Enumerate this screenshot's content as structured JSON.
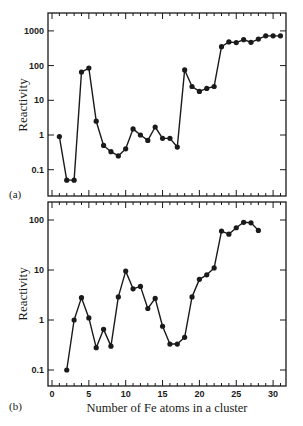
{
  "figure": {
    "xlabel": "Number of Fe atoms in a cluster",
    "panels": [
      {
        "label": "(a)",
        "ylabel": "Reactivity",
        "y_ticks": [
          {
            "value": 1000,
            "label": "1000"
          },
          {
            "value": 100,
            "label": "100"
          },
          {
            "value": 10,
            "label": "10"
          },
          {
            "value": 1,
            "label": "1"
          },
          {
            "value": 0.1,
            "label": "0.1"
          }
        ]
      },
      {
        "label": "(b)",
        "ylabel": "Reactivity",
        "y_ticks": [
          {
            "value": 100,
            "label": "100"
          },
          {
            "value": 10,
            "label": "10"
          },
          {
            "value": 1,
            "label": "1"
          },
          {
            "value": 0.1,
            "label": "0.1"
          }
        ],
        "x_ticks": [
          {
            "value": 0,
            "label": "0"
          },
          {
            "value": 5,
            "label": "5"
          },
          {
            "value": 10,
            "label": "10"
          },
          {
            "value": 15,
            "label": "15"
          },
          {
            "value": 20,
            "label": "20"
          },
          {
            "value": 25,
            "label": "25"
          },
          {
            "value": 30,
            "label": "30"
          }
        ]
      }
    ]
  },
  "chart_data": [
    {
      "type": "line",
      "title": "(a)",
      "xlabel": "Number of Fe atoms in a cluster",
      "ylabel": "Reactivity",
      "yscale": "log",
      "xlim": [
        0,
        31.5
      ],
      "ylim": [
        0.02,
        3000
      ],
      "grid": false,
      "x": [
        1,
        2,
        3,
        4,
        5,
        6,
        7,
        8,
        9,
        10,
        11,
        12,
        13,
        14,
        15,
        16,
        17,
        18,
        19,
        20,
        21,
        22,
        23,
        24,
        25,
        26,
        27,
        28,
        29,
        30,
        31
      ],
      "values": [
        0.9,
        0.05,
        0.05,
        65,
        85,
        2.5,
        0.5,
        0.33,
        0.25,
        0.4,
        1.5,
        1.0,
        0.7,
        1.7,
        0.8,
        0.8,
        0.45,
        75,
        25,
        18,
        22,
        25,
        350,
        480,
        460,
        560,
        470,
        580,
        720,
        720,
        720
      ]
    },
    {
      "type": "line",
      "title": "(b)",
      "xlabel": "Number of Fe atoms in a cluster",
      "ylabel": "Reactivity",
      "yscale": "log",
      "xlim": [
        0,
        31.5
      ],
      "ylim": [
        0.05,
        200
      ],
      "grid": false,
      "x": [
        2,
        3,
        4,
        5,
        6,
        7,
        8,
        9,
        10,
        11,
        12,
        13,
        14,
        15,
        16,
        17,
        18,
        19,
        20,
        21,
        22,
        23,
        24,
        25,
        26,
        27,
        28
      ],
      "values": [
        0.1,
        1.0,
        2.8,
        1.1,
        0.28,
        0.65,
        0.3,
        2.9,
        9.5,
        4.2,
        4.7,
        1.7,
        2.7,
        0.75,
        0.33,
        0.33,
        0.45,
        2.9,
        6.5,
        8.0,
        11,
        60,
        52,
        70,
        90,
        88,
        62
      ]
    }
  ]
}
